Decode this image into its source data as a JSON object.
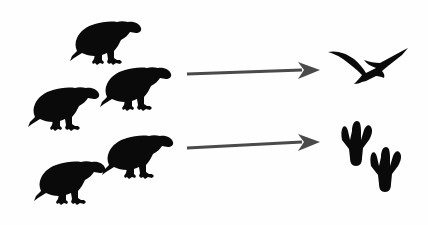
{
  "figure": {
    "width": 428,
    "height": 225,
    "background_color": "#fefefe",
    "silhouette_color": "#0a0a0a",
    "arrow_color": "#4a4a4a"
  },
  "birds": [
    {
      "id": "bird-top",
      "label": "bird-silhouette-top",
      "x": 68,
      "y": 12,
      "width": 78,
      "height": 70,
      "facing": "right"
    },
    {
      "id": "bird-middle-left",
      "label": "bird-silhouette-middle-left",
      "x": 26,
      "y": 78,
      "width": 78,
      "height": 70,
      "facing": "right"
    },
    {
      "id": "bird-middle-right",
      "label": "bird-silhouette-middle-right",
      "x": 98,
      "y": 58,
      "width": 78,
      "height": 70,
      "facing": "right"
    },
    {
      "id": "bird-bottom-left",
      "label": "bird-silhouette-bottom-left",
      "x": 32,
      "y": 152,
      "width": 78,
      "height": 70,
      "facing": "right"
    },
    {
      "id": "bird-bottom-right",
      "label": "bird-silhouette-bottom-right",
      "x": 100,
      "y": 126,
      "width": 78,
      "height": 70,
      "facing": "right"
    }
  ],
  "arrows": [
    {
      "id": "arrow-to-pterosaur",
      "label": "arrow-upper",
      "x": 186,
      "y": 60,
      "width": 136,
      "height": 24,
      "direction": "right",
      "color": "#4a4a4a"
    },
    {
      "id": "arrow-to-tracks",
      "label": "arrow-lower",
      "x": 186,
      "y": 132,
      "width": 136,
      "height": 24,
      "direction": "right",
      "color": "#4a4a4a"
    }
  ],
  "outcomes": [
    {
      "id": "pterosaur",
      "label": "pterosaur-flying-silhouette",
      "x": 326,
      "y": 44,
      "width": 84,
      "height": 52
    },
    {
      "id": "tracks",
      "label": "three-toed-footprint-pair",
      "x": 330,
      "y": 118,
      "width": 78,
      "height": 82,
      "toe_count": 3,
      "print_count": 2
    }
  ]
}
